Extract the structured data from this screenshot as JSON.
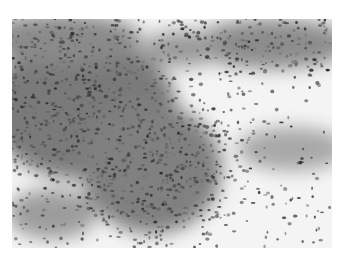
{
  "image": {
    "description": "Grayscale light-microscopy photomicrograph of densely packed small cells; dense dark cellular sheet on the upper-left and center, sparse scattered cells on the lower-right over pale background",
    "mode": "grayscale",
    "colors": {
      "background": "#ffffff",
      "field": "#f4f4f4",
      "dense_tissue": "#5a5a5a",
      "cell_nucleus": "#3c3c3c",
      "light_stroma": "#c8c8c8"
    }
  }
}
